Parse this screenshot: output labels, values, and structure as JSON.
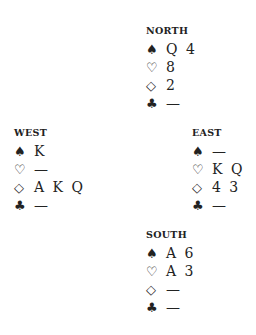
{
  "hands": {
    "north": {
      "label": "NORTH",
      "spades": "Q 4",
      "hearts": "8",
      "diamonds": "2",
      "clubs": "—"
    },
    "west": {
      "label": "WEST",
      "spades": "K",
      "hearts": "—",
      "diamonds": "A K Q",
      "clubs": "—"
    },
    "east": {
      "label": "EAST",
      "spades": "—",
      "hearts": "K Q",
      "diamonds": "4 3",
      "clubs": "—"
    },
    "south": {
      "label": "SOUTH",
      "spades": "A 6",
      "hearts": "A 3",
      "diamonds": "—",
      "clubs": "—"
    }
  },
  "suits": {
    "spades": "♠",
    "hearts": "♡",
    "diamonds": "◇",
    "clubs": "♣"
  }
}
